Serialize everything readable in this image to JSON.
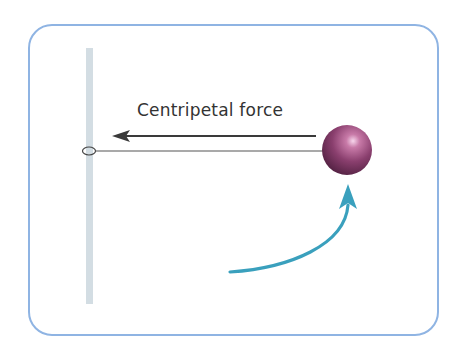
{
  "diagram": {
    "force_label": "Centripetal force",
    "colors": {
      "frame": "#8fb4e3",
      "pole": "#d3dde3",
      "arrow_force": "#3a3a3a",
      "string": "#555555",
      "ball": "#8a3f6e",
      "ball_highlight": "#f2c6e4",
      "motion_arrow": "#3aa0bd"
    },
    "elements": [
      "pole",
      "ring",
      "string",
      "ball",
      "centripetal-force-arrow",
      "motion-arrow"
    ]
  }
}
